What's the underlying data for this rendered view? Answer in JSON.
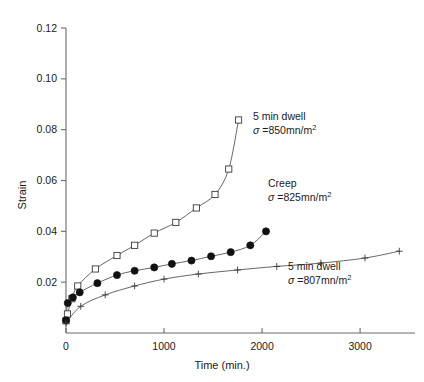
{
  "chart_data": {
    "type": "line",
    "title": "",
    "xlabel": "Time (min.)",
    "ylabel": "Strain",
    "xlim": [
      0,
      3560
    ],
    "ylim": [
      0,
      0.12
    ],
    "xticks": [
      0,
      1000,
      2000,
      3000
    ],
    "xtick_labels": [
      "0",
      "1000",
      "2000",
      "3000"
    ],
    "yticks": [
      0.02,
      0.04,
      0.06,
      0.08,
      0.1,
      0.12
    ],
    "ytick_labels": [
      "0.02",
      "0.04",
      "0.06",
      "0.08",
      "0.10",
      "0.12"
    ],
    "grid": false,
    "legend_position": "inline-annotations",
    "series": [
      {
        "name": "5 min dwell sigma=850mn/m2",
        "marker": "open-square",
        "label_line1": "5 min dwell",
        "label_sigma": "σ",
        "label_eq": " =850mn/m",
        "label_sup": "2",
        "x": [
          0,
          15,
          60,
          120,
          300,
          520,
          700,
          900,
          1120,
          1330,
          1520,
          1660,
          1760
        ],
        "y": [
          0.0048,
          0.0075,
          0.0135,
          0.0185,
          0.0252,
          0.0305,
          0.0345,
          0.0393,
          0.0435,
          0.0492,
          0.0545,
          0.0645,
          0.0838
        ]
      },
      {
        "name": "Creep sigma=825mn/m2",
        "marker": "filled-circle",
        "label_line1": "Creep",
        "label_sigma": "σ",
        "label_eq": " =825mn/m",
        "label_sup": "2",
        "x": [
          0,
          18,
          70,
          140,
          320,
          520,
          700,
          900,
          1080,
          1280,
          1480,
          1680,
          1880,
          2040
        ],
        "y": [
          0.005,
          0.0118,
          0.014,
          0.016,
          0.0196,
          0.0228,
          0.0245,
          0.0258,
          0.0272,
          0.0285,
          0.0302,
          0.0318,
          0.0345,
          0.04
        ]
      },
      {
        "name": "5 min dwell sigma=807mn/m2",
        "marker": "plus",
        "label_line1": "5 min dwell",
        "label_sigma": "σ",
        "label_eq": " =807mn/m",
        "label_sup": "2",
        "x": [
          0,
          150,
          400,
          700,
          1000,
          1350,
          1750,
          2150,
          2600,
          3050,
          3400
        ],
        "y": [
          0.004,
          0.0105,
          0.015,
          0.0185,
          0.0212,
          0.0232,
          0.0248,
          0.0262,
          0.0275,
          0.0295,
          0.0322
        ]
      }
    ]
  }
}
